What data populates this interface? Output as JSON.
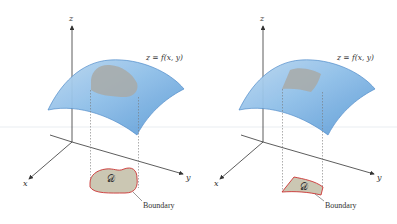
{
  "figure": {
    "colors": {
      "surface_fill": "#6fa9dc",
      "surface_edge": "#3f7fbf",
      "region_fill": "#c9c6b4",
      "region_edge": "#cc3333",
      "axis": "#333333",
      "dashed": "#777777",
      "surface_patch": "#a9aaa6"
    },
    "panels": [
      {
        "id": "left",
        "axis_labels": {
          "x": "x",
          "y": "y",
          "z": "z"
        },
        "surface_label": "z = f(x, y)",
        "region_label": "𝒟",
        "boundary_label": "Boundary",
        "region_shape": "irregular blob"
      },
      {
        "id": "right",
        "axis_labels": {
          "x": "x",
          "y": "y",
          "z": "z"
        },
        "surface_label": "z = f(x, y)",
        "region_label": "𝒟",
        "boundary_label": "Boundary",
        "region_shape": "annular sector"
      }
    ]
  }
}
